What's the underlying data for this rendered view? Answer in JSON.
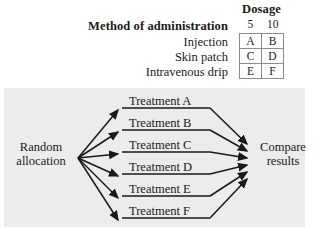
{
  "design": {
    "row_factor_label": "Method of administration",
    "column_factor_label": "Dosage",
    "dosage_levels": [
      "5",
      "10"
    ],
    "methods": [
      "Injection",
      "Skin patch",
      "Intravenous drip"
    ],
    "cells": [
      [
        "A",
        "B"
      ],
      [
        "C",
        "D"
      ],
      [
        "E",
        "F"
      ]
    ]
  },
  "flow": {
    "start_line1": "Random",
    "start_line2": "allocation",
    "end_line1": "Compare",
    "end_line2": "results",
    "treatments": [
      "Treatment A",
      "Treatment B",
      "Treatment C",
      "Treatment D",
      "Treatment E",
      "Treatment F"
    ],
    "panel_color": "#ececec",
    "line_color": "#1a1a1a"
  }
}
